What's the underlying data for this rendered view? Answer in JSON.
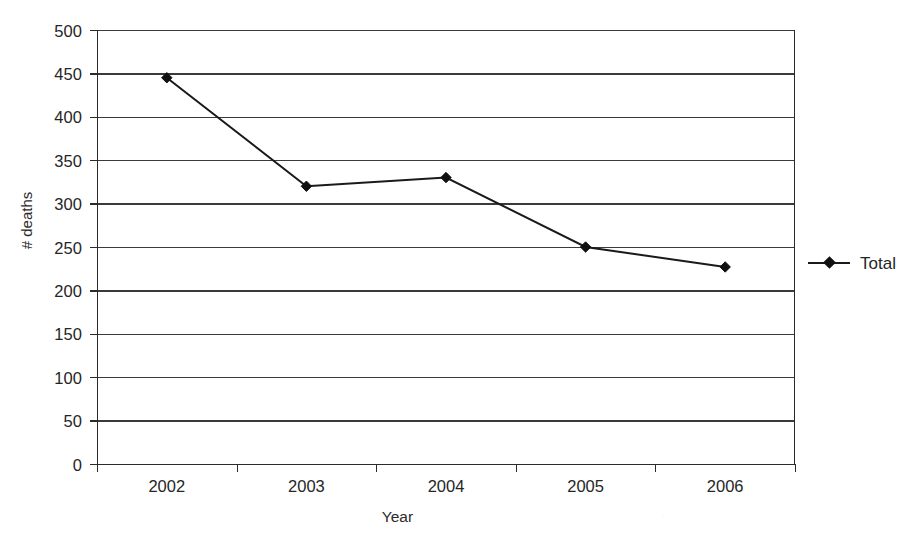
{
  "chart_data": {
    "type": "line",
    "title": "",
    "xlabel": "Year",
    "ylabel": "# deaths",
    "categories": [
      "2002",
      "2003",
      "2004",
      "2005",
      "2006"
    ],
    "series": [
      {
        "name": "Total",
        "values": [
          445,
          320,
          330,
          250,
          227
        ],
        "marker": "diamond",
        "color": "#1a1a1a"
      }
    ],
    "ylim": [
      0,
      500
    ],
    "ytick_labels": [
      "500",
      "450",
      "400",
      "350",
      "300",
      "250",
      "200",
      "150",
      "100",
      "50",
      "0"
    ],
    "ytick_values": [
      500,
      450,
      400,
      350,
      300,
      250,
      200,
      150,
      100,
      50,
      0
    ],
    "ytick_step": 50,
    "grid": "horizontal",
    "legend_position": "right",
    "legend_entries": [
      "Total"
    ]
  },
  "colors": {
    "line": "#1a1a1a",
    "marker": "#111111",
    "grid": "#3a3a3a",
    "axis": "#2b2b2b",
    "text": "#262626",
    "background": "#ffffff"
  },
  "legend": {
    "items": [
      {
        "label": "Total"
      }
    ]
  }
}
